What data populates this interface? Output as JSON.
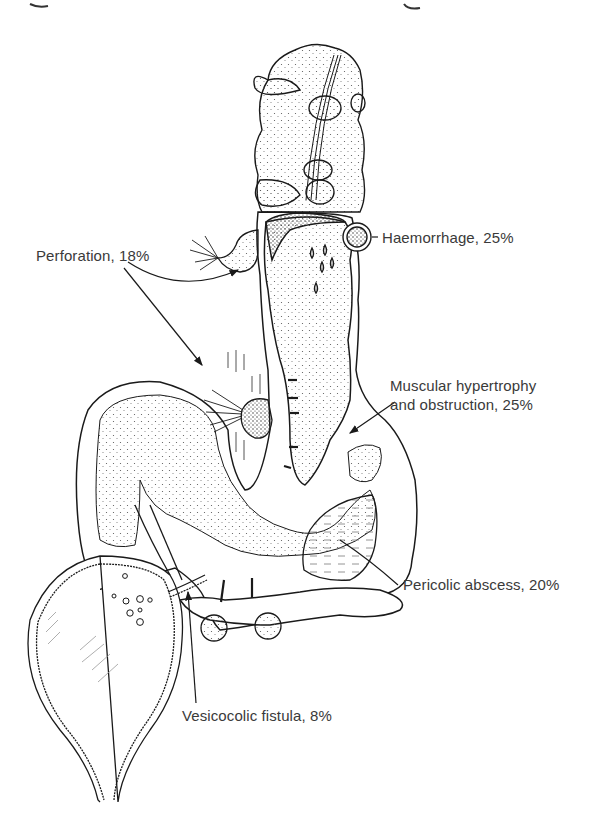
{
  "figure": {
    "line_color": "#1a1a1a",
    "text_color": "#3a3a3a",
    "background": "#ffffff"
  },
  "labels": {
    "haemorrhage": "Haemorrhage, 25%",
    "perforation": "Perforation, 18%",
    "muscular_line1": "Muscular hypertrophy",
    "muscular_line2": "and obstruction, 25%",
    "pericolic": "Pericolic abscess, 20%",
    "vesicocolic": "Vesicocolic fistula, 8%"
  },
  "complications": [
    {
      "name": "Haemorrhage",
      "percent": 25
    },
    {
      "name": "Perforation",
      "percent": 18
    },
    {
      "name": "Muscular hypertrophy and obstruction",
      "percent": 25
    },
    {
      "name": "Pericolic abscess",
      "percent": 20
    },
    {
      "name": "Vesicocolic fistula",
      "percent": 8
    }
  ]
}
